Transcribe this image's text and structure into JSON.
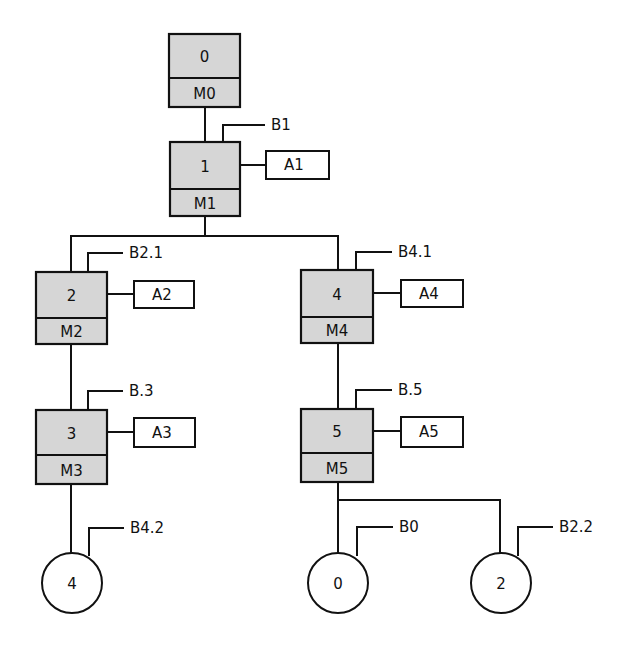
{
  "diagram": {
    "type": "sequential step/transition flow diagram",
    "colors": {
      "step_fill": "#d6d6d6",
      "line": "#111111",
      "background": "#ffffff"
    },
    "steps": [
      {
        "id": "0",
        "label": "0",
        "marker": "M0",
        "x": 169,
        "y": 34,
        "w": 71,
        "h": 73,
        "div": 44
      },
      {
        "id": "1",
        "label": "1",
        "marker": "M1",
        "x": 170,
        "y": 142,
        "w": 70,
        "h": 74,
        "div": 47,
        "action": "A1",
        "transition": "B1"
      },
      {
        "id": "2",
        "label": "2",
        "marker": "M2",
        "x": 36,
        "y": 272,
        "w": 71,
        "h": 72,
        "div": 46,
        "action": "A2",
        "transition": "B2.1"
      },
      {
        "id": "3",
        "label": "3",
        "marker": "M3",
        "x": 36,
        "y": 410,
        "w": 71,
        "h": 74,
        "div": 45,
        "action": "A3",
        "transition": "B.3"
      },
      {
        "id": "4",
        "label": "4",
        "marker": "M4",
        "x": 301,
        "y": 270,
        "w": 72,
        "h": 73,
        "div": 47,
        "action": "A4",
        "transition": "B4.1"
      },
      {
        "id": "5",
        "label": "5",
        "marker": "M5",
        "x": 301,
        "y": 409,
        "w": 72,
        "h": 73,
        "div": 44,
        "action": "A5",
        "transition": "B.5"
      }
    ],
    "actions": [
      {
        "label": "A1",
        "x": 266,
        "y": 151,
        "w": 63,
        "h": 28,
        "from_x": 240,
        "cy": 165
      },
      {
        "label": "A2",
        "x": 134,
        "y": 281,
        "w": 60,
        "h": 27,
        "from_x": 107,
        "cy": 294
      },
      {
        "label": "A3",
        "x": 134,
        "y": 418,
        "w": 61,
        "h": 29,
        "from_x": 107,
        "cy": 432
      },
      {
        "label": "A4",
        "x": 401,
        "y": 280,
        "w": 62,
        "h": 27,
        "from_x": 373,
        "cy": 293
      },
      {
        "label": "A5",
        "x": 401,
        "y": 417,
        "w": 62,
        "h": 30,
        "from_x": 373,
        "cy": 431
      }
    ],
    "transitions": [
      {
        "label": "B1",
        "x": 223,
        "top": 125,
        "bottom": 142,
        "end_x": 265
      },
      {
        "label": "B2.1",
        "x": 88,
        "top": 253,
        "bottom": 272,
        "end_x": 123
      },
      {
        "label": "B.3",
        "x": 88,
        "top": 391,
        "bottom": 410,
        "end_x": 123
      },
      {
        "label": "B4.1",
        "x": 356,
        "top": 252,
        "bottom": 270,
        "end_x": 392
      },
      {
        "label": "B.5",
        "x": 356,
        "top": 390,
        "bottom": 409,
        "end_x": 392
      },
      {
        "label": "B4.2",
        "x": 89,
        "top": 528,
        "bottom": 556,
        "end_x": 124
      },
      {
        "label": "B0",
        "x": 357,
        "top": 527,
        "bottom": 556,
        "end_x": 393
      },
      {
        "label": "B2.2",
        "x": 518,
        "top": 527,
        "bottom": 556,
        "end_x": 553
      }
    ],
    "jumps": [
      {
        "label": "4",
        "cx": 72,
        "cy": 583,
        "r": 30,
        "meaning": "go to step 4"
      },
      {
        "label": "0",
        "cx": 338,
        "cy": 583,
        "r": 30,
        "meaning": "go to step 0"
      },
      {
        "label": "2",
        "cx": 501,
        "cy": 583,
        "r": 30,
        "meaning": "go to step 2"
      }
    ],
    "connections": [
      {
        "points": "205,107 205,142"
      },
      {
        "points": "205,216 205,236"
      },
      {
        "points": "71,272 71,236 338,236 338,270"
      },
      {
        "points": "71,344 71,410"
      },
      {
        "points": "338,343 338,409"
      },
      {
        "points": "71,484 71,553"
      },
      {
        "points": "338,482 338,553"
      },
      {
        "points": "338,500 500,500 500,553"
      }
    ]
  }
}
